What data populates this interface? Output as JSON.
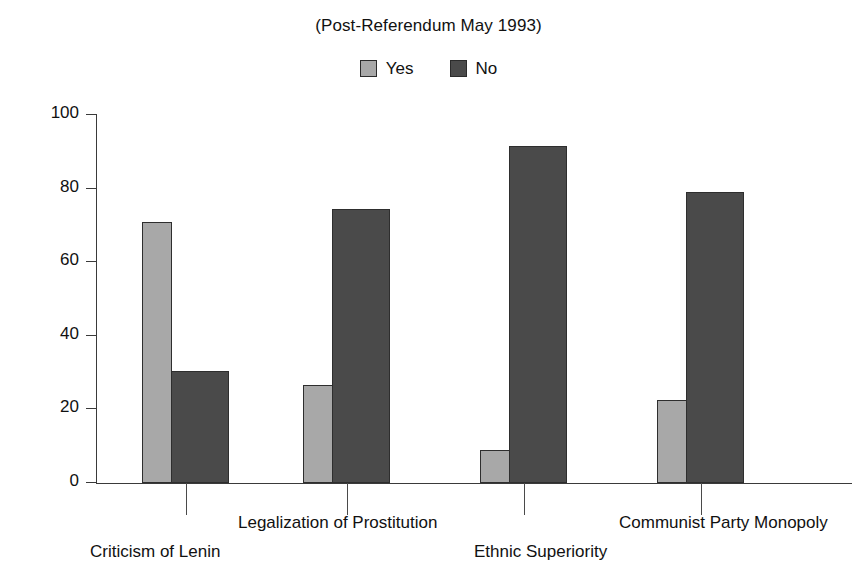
{
  "chart_data": {
    "type": "bar",
    "title": "(Post-Referendum May 1993)",
    "xlabel": "",
    "ylabel": "",
    "ylim": [
      0,
      100
    ],
    "yticks": [
      "0",
      "20",
      "40",
      "60",
      "80",
      "100"
    ],
    "grid": false,
    "legend_position": "top-center",
    "categories": [
      "Criticism of Lenin",
      "Legalization of Prostitution",
      "Ethnic Superiority",
      "Communist Party Monopoly"
    ],
    "series": [
      {
        "name": "Yes",
        "color": "#a8a8a8",
        "values": [
          71,
          26.5,
          9,
          22.5
        ]
      },
      {
        "name": "No",
        "color": "#4a4a4a",
        "values": [
          30.5,
          74.5,
          91.5,
          79
        ]
      }
    ]
  },
  "legend": {
    "items": [
      {
        "label": "Yes",
        "color": "#a8a8a8"
      },
      {
        "label": "No",
        "color": "#4a4a4a"
      }
    ]
  },
  "axis": {
    "y_ticks": [
      "100",
      "80",
      "60",
      "40",
      "20",
      "0"
    ]
  },
  "x_labels": {
    "row_top": [
      "Legalization of Prostitution",
      "Communist Party Monopoly"
    ],
    "row_bottom": [
      "Criticism of Lenin",
      "Ethnic Superiority"
    ]
  }
}
